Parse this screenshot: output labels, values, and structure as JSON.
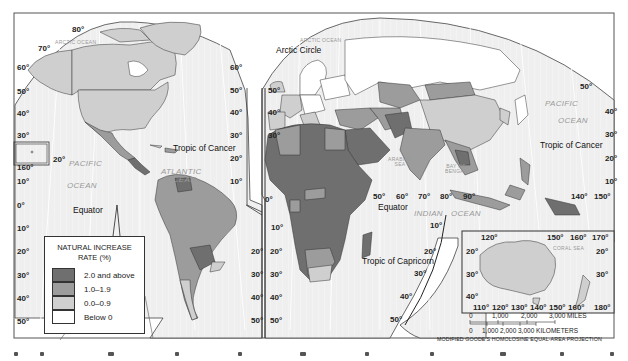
{
  "map": {
    "title_hidden": "",
    "projection_label": "MODIFIED GOODE'S HOMOLOSINE EQUAL-AREA PROJECTION",
    "colors": {
      "class_2_0_above": "#6f6f6f",
      "class_1_0_1_9": "#9c9c9c",
      "class_0_0_0_9": "#cfcfcf",
      "class_below_0": "#ffffff",
      "ocean": "#f1f1f1",
      "grid": "#ffffff",
      "border": "#333333"
    }
  },
  "legend": {
    "title_line1": "NATURAL INCREASE",
    "title_line2": "RATE (%)",
    "items": [
      {
        "label": "2.0 and above",
        "color": "#6f6f6f"
      },
      {
        "label": "1.0–1.9",
        "color": "#9c9c9c"
      },
      {
        "label": "0.0–0.9",
        "color": "#cfcfcf"
      },
      {
        "label": "Below 0",
        "color": "#ffffff"
      }
    ]
  },
  "labels": {
    "arctic_ocean_left": "ARCTIC OCEAN",
    "arctic_ocean_right": "ARCTIC OCEAN",
    "atlantic_ocean_1": "ATLANTIC",
    "atlantic_ocean_2": "OCEAN",
    "pacific_left_1": "PACIFIC",
    "pacific_left_2": "OCEAN",
    "pacific_right_1": "PACIFIC",
    "pacific_right_2": "OCEAN",
    "indian_ocean_1": "INDIAN",
    "indian_ocean_2": "OCEAN",
    "arabian_sea_1": "ARABIAN",
    "arabian_sea_2": "SEA",
    "bay_of_bengal_1": "BAY OF",
    "bay_of_bengal_2": "BENGAL",
    "coral_sea": "CORAL SEA",
    "arctic_circle": "Arctic Circle",
    "tropic_of_cancer_left": "Tropic of Cancer",
    "tropic_of_cancer_right": "Tropic of Cancer",
    "tropic_of_capricorn": "Tropic of Capricorn",
    "equator_left": "Equator",
    "equator_right": "Equator"
  },
  "degrees": {
    "top_80": "80°",
    "top_70": "70°",
    "left_axis": [
      "60°",
      "50°",
      "40°",
      "30°",
      "10°",
      "0°",
      "10°",
      "20°",
      "30°",
      "40°",
      "50°"
    ],
    "hawaii_160": "160°",
    "hawaii_20": "20°",
    "mid_left_axis": [
      "60°",
      "50°",
      "40°",
      "30°",
      "20°",
      "10°"
    ],
    "mid_right_axis": [
      "50°",
      "40°",
      "30°"
    ],
    "mid_lower_left": [
      "20°",
      "30°",
      "40°",
      "50°"
    ],
    "mid_lower_right": [
      "20°",
      "30°",
      "40°",
      "50°"
    ],
    "zero_lon": "0°",
    "africa_10s": "10°",
    "asia_lon": [
      "50°",
      "60°",
      "70°",
      "80°",
      "90°"
    ],
    "indian_10": "10°",
    "right_lat": [
      "50°",
      "40°",
      "30°",
      "20°",
      "10°"
    ],
    "pacific_lon": [
      "140°",
      "150°"
    ],
    "indian_lower": [
      "20°",
      "30°",
      "40°",
      "50°"
    ]
  },
  "inset": {
    "top_lon": [
      "120°",
      "150°",
      "160°",
      "170°"
    ],
    "left_lat": [
      "20°",
      "30°",
      "40°"
    ],
    "right_lat": [
      "20°",
      "30°"
    ],
    "bottom_lon": [
      "110°",
      "120°",
      "130°",
      "140°",
      "150°",
      "160°",
      "180°"
    ]
  },
  "scale": {
    "miles": [
      "0",
      "1,000",
      "2,000",
      "3,000 MILES"
    ],
    "kilometers": [
      "0",
      "1,000",
      "2,000",
      "3,000 KILOMETERS"
    ]
  }
}
